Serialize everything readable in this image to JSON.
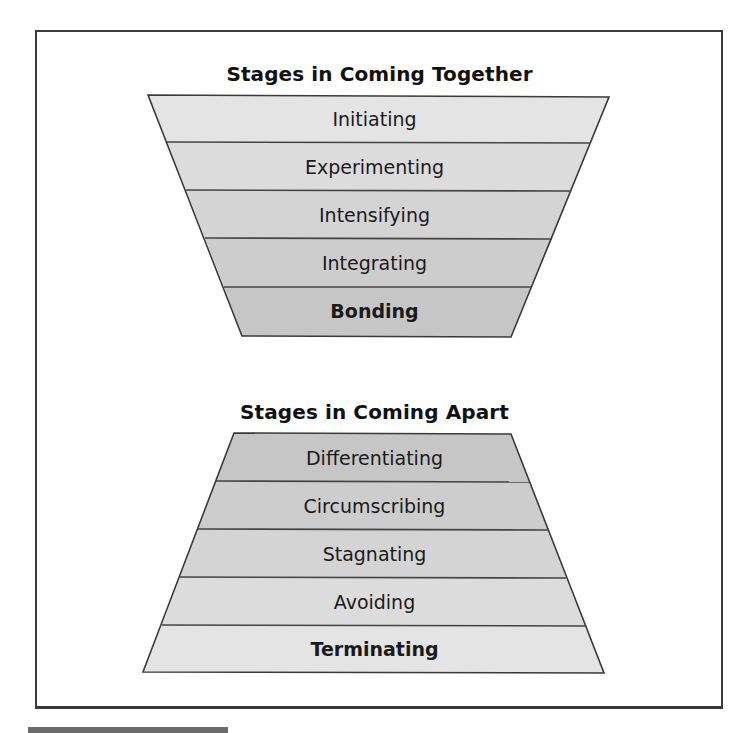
{
  "diagram": {
    "together": {
      "title": "Stages in Coming Together",
      "stages": [
        {
          "label": "Initiating",
          "bold": false,
          "fill": "#e4e4e4"
        },
        {
          "label": "Experimenting",
          "bold": false,
          "fill": "#dcdcdc"
        },
        {
          "label": "Intensifying",
          "bold": false,
          "fill": "#d4d4d4"
        },
        {
          "label": "Integrating",
          "bold": false,
          "fill": "#cdcdcd"
        },
        {
          "label": "Bonding",
          "bold": true,
          "fill": "#c6c6c6"
        }
      ]
    },
    "apart": {
      "title": "Stages in Coming Apart",
      "stages": [
        {
          "label": "Differentiating",
          "bold": false,
          "fill": "#c6c6c6"
        },
        {
          "label": "Circumscribing",
          "bold": false,
          "fill": "#cdcdcd"
        },
        {
          "label": "Stagnating",
          "bold": false,
          "fill": "#d4d4d4"
        },
        {
          "label": "Avoiding",
          "bold": false,
          "fill": "#dcdcdc"
        },
        {
          "label": "Terminating",
          "bold": true,
          "fill": "#e4e4e4"
        }
      ]
    },
    "colors": {
      "outline": "#3a3a3a",
      "divider": "#444444",
      "text": "#1a1a1a"
    }
  }
}
